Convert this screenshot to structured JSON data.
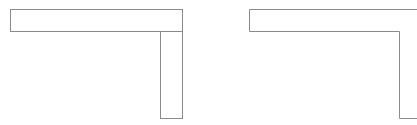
{
  "canvas": {
    "width": 417,
    "height": 125,
    "background": "#ffffff"
  },
  "stroke": {
    "color": "#8a8a8a",
    "width": 1
  },
  "shapes": [
    {
      "name": "left-t-shape",
      "parts": [
        {
          "name": "top-bar",
          "x": 10,
          "y": 9,
          "w": 172,
          "h": 22
        },
        {
          "name": "vertical-bar",
          "x": 160,
          "y": 31,
          "w": 22,
          "h": 87
        }
      ]
    },
    {
      "name": "right-l-outline",
      "points": "249,9 417,9 M249,9 249,31 399,31 399,118 417,118"
    }
  ]
}
